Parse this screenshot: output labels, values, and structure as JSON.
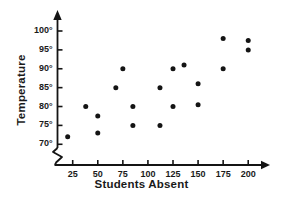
{
  "chart_data": {
    "type": "scatter",
    "title": "",
    "xlabel": "Students Absent",
    "ylabel": "Temperature",
    "xlim": [
      0,
      212
    ],
    "ylim": [
      68.5,
      101.5
    ],
    "grid": false,
    "legend": "none",
    "y_axis_break": true,
    "xticks": [
      25,
      50,
      75,
      100,
      125,
      150,
      175,
      200
    ],
    "xtick_labels": [
      "25",
      "50",
      "75",
      "100",
      "125",
      "150",
      "175",
      "200"
    ],
    "yticks": [
      70,
      75,
      80,
      85,
      90,
      95,
      100
    ],
    "ytick_labels": [
      "70°",
      "75°",
      "80°",
      "85°",
      "90°",
      "95°",
      "100°"
    ],
    "marker": "filled-circle",
    "marker_color": "#141414",
    "axis_color": "#141414",
    "points": [
      {
        "x": 20,
        "y": 72
      },
      {
        "x": 38,
        "y": 80
      },
      {
        "x": 50,
        "y": 77.5
      },
      {
        "x": 50,
        "y": 73
      },
      {
        "x": 68,
        "y": 85
      },
      {
        "x": 75,
        "y": 90
      },
      {
        "x": 85,
        "y": 80
      },
      {
        "x": 85,
        "y": 75
      },
      {
        "x": 112,
        "y": 85
      },
      {
        "x": 112,
        "y": 75
      },
      {
        "x": 125,
        "y": 90
      },
      {
        "x": 125,
        "y": 80
      },
      {
        "x": 136,
        "y": 91
      },
      {
        "x": 150,
        "y": 86
      },
      {
        "x": 150,
        "y": 80.5
      },
      {
        "x": 175,
        "y": 98
      },
      {
        "x": 175,
        "y": 90
      },
      {
        "x": 200,
        "y": 97.5
      },
      {
        "x": 200,
        "y": 95
      }
    ]
  }
}
